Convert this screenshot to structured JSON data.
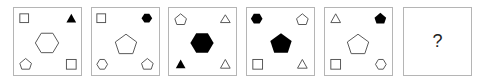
{
  "puzzle": {
    "panels": [
      {
        "id": 1,
        "top_left": "square-outline",
        "top_right": "triangle-filled",
        "center": "hexagon-outline",
        "bottom_left": "pentagon-outline",
        "bottom_right": "square-outline"
      },
      {
        "id": 2,
        "top_left": "square-outline",
        "top_right": "hexagon-filled",
        "center": "pentagon-outline",
        "bottom_left": "hexagon-outline",
        "bottom_right": "pentagon-outline"
      },
      {
        "id": 3,
        "top_left": "pentagon-outline",
        "top_right": "triangle-outline",
        "center": "hexagon-filled",
        "bottom_left": "triangle-filled",
        "bottom_right": "triangle-outline"
      },
      {
        "id": 4,
        "top_left": "hexagon-filled",
        "top_right": "pentagon-outline",
        "center": "pentagon-filled",
        "bottom_left": "square-outline",
        "bottom_right": "triangle-outline"
      },
      {
        "id": 5,
        "top_left": "triangle-outline",
        "top_right": "pentagon-filled",
        "center": "pentagon-outline",
        "bottom_left": "square-outline",
        "bottom_right": "hexagon-outline"
      },
      {
        "id": 6,
        "question_mark": "?"
      }
    ],
    "colors": {
      "stroke": "#555555",
      "fill": "#000000",
      "border": "#b5b5b5"
    }
  }
}
